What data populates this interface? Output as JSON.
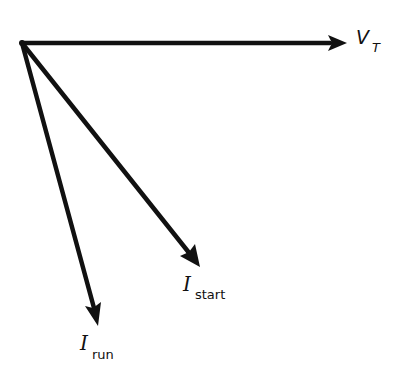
{
  "diagram": {
    "type": "phasor-diagram",
    "origin": {
      "x": 22,
      "y": 43
    },
    "stroke_color": "#111111",
    "vectors": [
      {
        "id": "vt",
        "symbol": "V",
        "subscript": "T",
        "tip": {
          "x": 347,
          "y": 43
        }
      },
      {
        "id": "istart",
        "symbol": "I",
        "subscript": "start",
        "tip": {
          "x": 200,
          "y": 267
        }
      },
      {
        "id": "irun",
        "symbol": "I",
        "subscript": "run",
        "tip": {
          "x": 98,
          "y": 326
        }
      }
    ]
  },
  "labels": {
    "vt": {
      "main": "V",
      "sub": "T"
    },
    "istart": {
      "main": "I",
      "sub": "start"
    },
    "irun": {
      "main": "I",
      "sub": "run"
    }
  }
}
